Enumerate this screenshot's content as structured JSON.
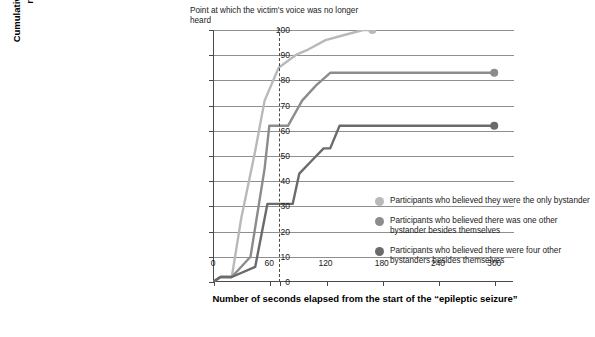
{
  "chart_data": {
    "type": "line",
    "title": "",
    "xlabel": "Number of seconds elapsed from the start of the “epileptic seizure”",
    "ylabel": "Cumulative percentage of participants responding with help",
    "xlim": [
      0,
      320
    ],
    "ylim": [
      0,
      100
    ],
    "xticks": [
      0,
      60,
      120,
      180,
      240,
      300
    ],
    "yticks": [
      0,
      10,
      20,
      30,
      40,
      50,
      60,
      70,
      80,
      90,
      100
    ],
    "grid": true,
    "grid_axis": "y",
    "legend_position": "right",
    "annotation": "Point at which the victim's voice was no longer heard",
    "annotation_x": 70,
    "series": [
      {
        "name": "Participants who believed they were the only bystander",
        "color": "#b9b9b9",
        "points": [
          [
            0,
            0
          ],
          [
            8,
            2
          ],
          [
            20,
            2
          ],
          [
            30,
            25
          ],
          [
            45,
            52
          ],
          [
            55,
            72
          ],
          [
            70,
            85
          ],
          [
            88,
            90
          ],
          [
            100,
            92
          ],
          [
            120,
            96
          ],
          [
            140,
            98
          ],
          [
            160,
            100
          ],
          [
            170,
            100
          ]
        ],
        "endpoint": [
          170,
          100
        ]
      },
      {
        "name": "Participants who believed there was one other bystander besides themselves",
        "color": "#8c8c8c",
        "points": [
          [
            0,
            0
          ],
          [
            8,
            2
          ],
          [
            20,
            2
          ],
          [
            40,
            10
          ],
          [
            55,
            45
          ],
          [
            60,
            62
          ],
          [
            62,
            62
          ],
          [
            80,
            62
          ],
          [
            95,
            72
          ],
          [
            110,
            78
          ],
          [
            125,
            83
          ],
          [
            140,
            83
          ],
          [
            300,
            83
          ]
        ],
        "endpoint": [
          300,
          83
        ]
      },
      {
        "name": "Participants who believed there were four other bystanders besides themselves",
        "color": "#6b6b6b",
        "points": [
          [
            0,
            0
          ],
          [
            8,
            2
          ],
          [
            20,
            2
          ],
          [
            45,
            6
          ],
          [
            58,
            31
          ],
          [
            62,
            31
          ],
          [
            85,
            31
          ],
          [
            92,
            43
          ],
          [
            105,
            48
          ],
          [
            118,
            53
          ],
          [
            125,
            53
          ],
          [
            135,
            62
          ],
          [
            150,
            62
          ],
          [
            300,
            62
          ]
        ],
        "endpoint": [
          300,
          62
        ]
      }
    ]
  },
  "legend": {
    "items": [
      {
        "label": "Participants who believed they were the only bystander",
        "color": "#b9b9b9"
      },
      {
        "label": "Participants who believed there was one other bystander besides themselves",
        "color": "#8c8c8c"
      },
      {
        "label": "Participants who believed there were four other bystanders besides themselves",
        "color": "#6b6b6b"
      }
    ]
  }
}
